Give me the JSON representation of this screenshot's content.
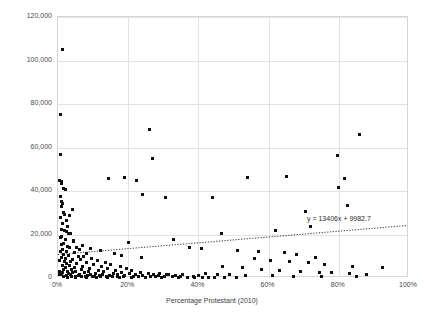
{
  "chart_data": {
    "type": "scatter",
    "title": "",
    "xlabel": "Percentage Protestant (2010)",
    "ylabel": "Real 2010 per capita GDP in USD",
    "xlim": [
      0,
      100
    ],
    "ylim": [
      0,
      120000
    ],
    "xticks": [
      "0%",
      "20%",
      "40%",
      "60%",
      "80%",
      "100%"
    ],
    "xtick_values": [
      0,
      20,
      40,
      60,
      80,
      100
    ],
    "yticks": [
      "0",
      "20,000",
      "40,000",
      "60,000",
      "80,000",
      "100,000",
      "120,000"
    ],
    "ytick_values": [
      0,
      20000,
      40000,
      60000,
      80000,
      100000,
      120000
    ],
    "grid": true,
    "legend": "none",
    "trendline": {
      "type": "linear-dotted",
      "equation": "y = 13406x + 9982.7",
      "slope": 13406,
      "intercept": 9982.7,
      "x_start": 0,
      "x_end": 100,
      "y_start": 9982.7,
      "y_end": 23388.7
    },
    "points": [
      [
        1.2,
        105200
      ],
      [
        0.8,
        75100
      ],
      [
        0.6,
        56800
      ],
      [
        0.5,
        44800
      ],
      [
        0.9,
        44200
      ],
      [
        1.0,
        43600
      ],
      [
        1.6,
        41200
      ],
      [
        2.0,
        40800
      ],
      [
        0.7,
        37600
      ],
      [
        1.1,
        35000
      ],
      [
        1.3,
        34200
      ],
      [
        0.9,
        32800
      ],
      [
        1.5,
        30200
      ],
      [
        4.1,
        31600
      ],
      [
        1.8,
        29400
      ],
      [
        3.2,
        28600
      ],
      [
        0.8,
        27800
      ],
      [
        1.4,
        25200
      ],
      [
        2.6,
        23600
      ],
      [
        1.0,
        22400
      ],
      [
        1.9,
        21800
      ],
      [
        2.3,
        21200
      ],
      [
        3.0,
        20600
      ],
      [
        3.6,
        20300
      ],
      [
        1.1,
        19200
      ],
      [
        0.6,
        18400
      ],
      [
        2.1,
        17500
      ],
      [
        4.5,
        16800
      ],
      [
        1.7,
        15900
      ],
      [
        0.9,
        15200
      ],
      [
        2.8,
        14600
      ],
      [
        3.4,
        14100
      ],
      [
        5.2,
        13800
      ],
      [
        1.3,
        13200
      ],
      [
        6.1,
        12900
      ],
      [
        0.7,
        12400
      ],
      [
        2.4,
        12000
      ],
      [
        4.8,
        11700
      ],
      [
        8.2,
        11200
      ],
      [
        1.5,
        10800
      ],
      [
        3.1,
        10400
      ],
      [
        5.9,
        10100
      ],
      [
        7.4,
        9800
      ],
      [
        1.0,
        9400
      ],
      [
        2.2,
        9100
      ],
      [
        9.6,
        8900
      ],
      [
        4.0,
        8600
      ],
      [
        6.5,
        8300
      ],
      [
        11.2,
        8100
      ],
      [
        1.8,
        7800
      ],
      [
        3.7,
        7500
      ],
      [
        8.0,
        7200
      ],
      [
        13.5,
        7000
      ],
      [
        2.5,
        6800
      ],
      [
        5.4,
        6500
      ],
      [
        10.1,
        6300
      ],
      [
        15.0,
        6100
      ],
      [
        1.2,
        5900
      ],
      [
        3.3,
        5700
      ],
      [
        7.1,
        5500
      ],
      [
        12.4,
        5300
      ],
      [
        17.8,
        5100
      ],
      [
        2.0,
        4900
      ],
      [
        4.6,
        4700
      ],
      [
        9.0,
        4500
      ],
      [
        14.2,
        4300
      ],
      [
        19.5,
        4200
      ],
      [
        1.6,
        4000
      ],
      [
        3.9,
        3900
      ],
      [
        6.8,
        3700
      ],
      [
        11.5,
        3600
      ],
      [
        16.3,
        3400
      ],
      [
        21.0,
        3300
      ],
      [
        2.7,
        3200
      ],
      [
        5.1,
        3000
      ],
      [
        8.7,
        2900
      ],
      [
        13.0,
        2800
      ],
      [
        18.2,
        2700
      ],
      [
        23.5,
        2600
      ],
      [
        1.4,
        2500
      ],
      [
        4.2,
        2400
      ],
      [
        7.6,
        2300
      ],
      [
        10.8,
        2200
      ],
      [
        15.7,
        2100
      ],
      [
        20.4,
        2000
      ],
      [
        25.8,
        1950
      ],
      [
        2.9,
        1900
      ],
      [
        6.2,
        1800
      ],
      [
        9.4,
        1750
      ],
      [
        12.8,
        1700
      ],
      [
        17.0,
        1650
      ],
      [
        22.2,
        1600
      ],
      [
        27.3,
        1550
      ],
      [
        31.0,
        1500
      ],
      [
        1.1,
        1450
      ],
      [
        3.5,
        1400
      ],
      [
        5.7,
        1350
      ],
      [
        8.4,
        1300
      ],
      [
        11.9,
        1250
      ],
      [
        14.8,
        1200
      ],
      [
        19.0,
        1150
      ],
      [
        24.0,
        1100
      ],
      [
        28.6,
        1050
      ],
      [
        33.4,
        1000
      ],
      [
        2.3,
        950
      ],
      [
        4.9,
        900
      ],
      [
        7.9,
        880
      ],
      [
        10.5,
        850
      ],
      [
        13.8,
        820
      ],
      [
        16.9,
        800
      ],
      [
        21.6,
        780
      ],
      [
        26.4,
        750
      ],
      [
        30.2,
        720
      ],
      [
        35.0,
        700
      ],
      [
        38.5,
        680
      ],
      [
        1.7,
        650
      ],
      [
        3.8,
        630
      ],
      [
        6.6,
        610
      ],
      [
        9.8,
        590
      ],
      [
        12.2,
        570
      ],
      [
        15.4,
        550
      ],
      [
        18.8,
        530
      ],
      [
        23.0,
        510
      ],
      [
        27.9,
        490
      ],
      [
        32.6,
        470
      ],
      [
        36.8,
        450
      ],
      [
        41.2,
        430
      ],
      [
        44.6,
        410
      ],
      [
        2.6,
        400
      ],
      [
        5.0,
        390
      ],
      [
        8.1,
        380
      ],
      [
        11.0,
        370
      ],
      [
        14.0,
        360
      ],
      [
        17.5,
        350
      ],
      [
        20.8,
        340
      ],
      [
        25.0,
        330
      ],
      [
        29.4,
        320
      ],
      [
        34.2,
        310
      ],
      [
        39.0,
        300
      ],
      [
        43.0,
        290
      ],
      [
        47.5,
        280
      ],
      [
        50.8,
        270
      ],
      [
        26.0,
        68200
      ],
      [
        54.0,
        46400
      ],
      [
        65.0,
        46800
      ],
      [
        22.5,
        44600
      ],
      [
        19.0,
        46200
      ],
      [
        14.5,
        45800
      ],
      [
        27.0,
        54800
      ],
      [
        24.0,
        38400
      ],
      [
        30.5,
        37200
      ],
      [
        44.0,
        36800
      ],
      [
        86.0,
        66000
      ],
      [
        79.5,
        56200
      ],
      [
        81.5,
        45800
      ],
      [
        80.0,
        41600
      ],
      [
        82.5,
        33400
      ],
      [
        70.5,
        30800
      ],
      [
        72.0,
        23600
      ],
      [
        62.0,
        21800
      ],
      [
        46.5,
        20400
      ],
      [
        33.0,
        17600
      ],
      [
        20.0,
        16400
      ],
      [
        37.5,
        14200
      ],
      [
        41.0,
        13400
      ],
      [
        51.0,
        12800
      ],
      [
        57.0,
        12200
      ],
      [
        64.5,
        11600
      ],
      [
        68.0,
        10800
      ],
      [
        73.5,
        9400
      ],
      [
        56.0,
        8800
      ],
      [
        60.5,
        8200
      ],
      [
        66.0,
        7600
      ],
      [
        71.5,
        6900
      ],
      [
        76.0,
        6100
      ],
      [
        84.0,
        5400
      ],
      [
        92.5,
        4800
      ],
      [
        47.0,
        5200
      ],
      [
        52.5,
        4600
      ],
      [
        58.0,
        4100
      ],
      [
        63.0,
        3600
      ],
      [
        69.0,
        3100
      ],
      [
        74.5,
        2700
      ],
      [
        78.0,
        2300
      ],
      [
        83.0,
        1900
      ],
      [
        88.0,
        1500
      ],
      [
        42.0,
        2000
      ],
      [
        45.5,
        1700
      ],
      [
        49.0,
        1400
      ],
      [
        53.5,
        1200
      ],
      [
        61.0,
        1000
      ],
      [
        67.0,
        900
      ],
      [
        75.0,
        800
      ],
      [
        85.0,
        700
      ],
      [
        29.0,
        2200
      ],
      [
        31.5,
        1800
      ],
      [
        35.5,
        1500
      ],
      [
        40.0,
        1300
      ],
      [
        23.8,
        9600
      ],
      [
        18.0,
        10200
      ],
      [
        16.0,
        11400
      ],
      [
        12.0,
        12600
      ],
      [
        9.2,
        13600
      ],
      [
        7.0,
        14800
      ],
      [
        4.4,
        17200
      ],
      [
        2.4,
        26400
      ],
      [
        0.4,
        8000
      ],
      [
        0.3,
        3000
      ],
      [
        0.5,
        1500
      ]
    ]
  }
}
